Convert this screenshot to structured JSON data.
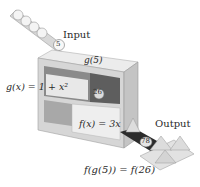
{
  "diagram": {
    "input_label": "Input",
    "output_label": "Output",
    "input_value": "5",
    "intermediate_value": "26",
    "output_value": "78",
    "g_output_label": "g(5)",
    "g_function_label": "g(x) = 1 + x²",
    "f_function_label": "f(x) = 3x",
    "composition_label": "f(g(5)) = f(26)",
    "colors": {
      "machine_light": "#e6e6e6",
      "machine_mid": "#bdbdbd",
      "machine_dark": "#6e6e6e",
      "belt": "#2b2b2b",
      "ball": "#f2f2f2"
    }
  }
}
